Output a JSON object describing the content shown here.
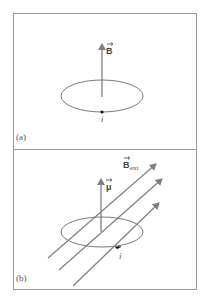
{
  "figure": {
    "colors": {
      "frame": "#9a9a9a",
      "loop": "#7a7a7a",
      "arrow": "#7f7f7f",
      "text": "#555555",
      "current_dot": "#111111"
    },
    "panel_a": {
      "label": "(a)",
      "vector_label": "B",
      "current_label": "i"
    },
    "panel_b": {
      "label": "(b)",
      "moment_label": "μ",
      "field_label": "B",
      "field_subscript": "ext",
      "current_label": "i"
    }
  }
}
